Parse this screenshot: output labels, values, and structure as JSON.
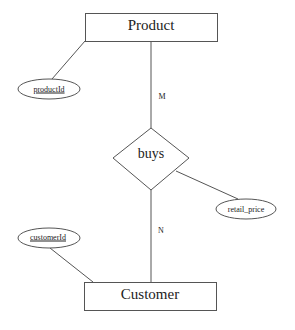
{
  "diagram": {
    "type": "er-diagram",
    "colors": {
      "stroke": "#555555",
      "text": "#222222",
      "background": "#ffffff"
    },
    "entities": [
      {
        "id": "product",
        "label": "Product"
      },
      {
        "id": "customer",
        "label": "Customer"
      }
    ],
    "relationships": [
      {
        "id": "buys",
        "label": "buys"
      }
    ],
    "attributes": [
      {
        "id": "productId",
        "label": "productId",
        "owner": "Product",
        "key": true
      },
      {
        "id": "customerId",
        "label": "customerId",
        "owner": "Customer",
        "key": true
      },
      {
        "id": "retail_price",
        "label": "retail_price",
        "owner": "buys",
        "key": false
      }
    ],
    "cardinalities": [
      {
        "side": "Product",
        "label": "M"
      },
      {
        "side": "Customer",
        "label": "N"
      }
    ]
  }
}
